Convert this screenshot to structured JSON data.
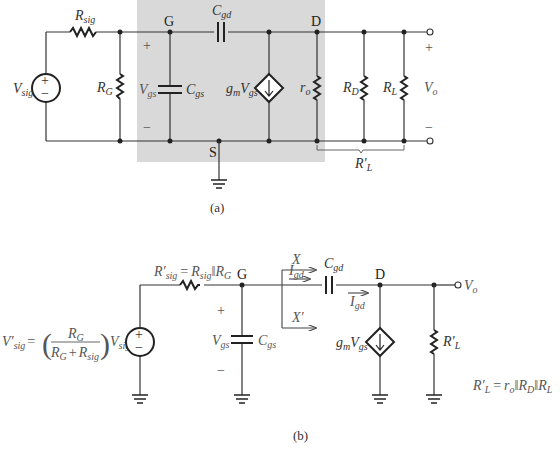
{
  "figure_a": {
    "caption": "(a)",
    "nodes": {
      "gate": "G",
      "drain": "D",
      "source": "S"
    },
    "components": {
      "source": {
        "name": "V",
        "sub": "sig",
        "polarity_plus": "+",
        "polarity_minus": "−"
      },
      "r_sig": {
        "name": "R",
        "sub": "sig"
      },
      "r_g": {
        "name": "R",
        "sub": "G"
      },
      "c_gs": {
        "name": "C",
        "sub": "gs"
      },
      "c_gd": {
        "name": "C",
        "sub": "gd"
      },
      "dep_source": {
        "name": "g",
        "sub1": "m",
        "mid": "V",
        "sub2": "gs"
      },
      "r_o": {
        "name": "r",
        "sub": "o"
      },
      "r_d": {
        "name": "R",
        "sub": "D"
      },
      "r_l": {
        "name": "R",
        "sub": "L"
      }
    },
    "vgs": {
      "name": "V",
      "sub": "gs",
      "plus": "+",
      "minus": "−"
    },
    "vo": {
      "name": "V",
      "sub": "o",
      "plus": "+",
      "minus": "−"
    },
    "bracket_label": {
      "name": "R′",
      "sub": "L"
    }
  },
  "figure_b": {
    "caption": "(b)",
    "nodes": {
      "gate": "G",
      "drain": "D"
    },
    "source_eq": {
      "lhs": "V′",
      "lhs_sub": "sig",
      "eq": "=",
      "num": "R",
      "num_sub": "G",
      "den_a": "R",
      "den_a_sub": "G",
      "den_plus": "+",
      "den_b": "R",
      "den_b_sub": "sig",
      "rhs": "V",
      "rhs_sub": "sig"
    },
    "rsig_eq": {
      "lhs": "R′",
      "lhs_sub": "sig",
      "eq": "=",
      "a": "R",
      "a_sub": "sig",
      "par": "‖",
      "b": "R",
      "b_sub": "G"
    },
    "vgs": {
      "name": "V",
      "sub": "gs",
      "plus": "+",
      "minus": "−"
    },
    "c_gs": {
      "name": "C",
      "sub": "gs"
    },
    "c_gd": {
      "name": "C",
      "sub": "gd"
    },
    "i_gd": {
      "name": "I",
      "sub": "gd"
    },
    "cut_x": "X",
    "cut_x_prime": "X′",
    "dep_source": {
      "name": "g",
      "sub1": "m",
      "mid": "V",
      "sub2": "gs"
    },
    "r_l_prime": {
      "name": "R′",
      "sub": "L"
    },
    "vo": {
      "name": "V",
      "sub": "o"
    },
    "rl_eq": {
      "lhs": "R′",
      "lhs_sub": "L",
      "eq": "=",
      "a": "r",
      "a_sub": "o",
      "par1": "‖",
      "b": "R",
      "b_sub": "D",
      "par2": "‖",
      "c": "R",
      "c_sub": "L"
    }
  },
  "colors": {
    "wire": "#333333",
    "shade": "#d9d9d9",
    "background": "#ffffff"
  }
}
